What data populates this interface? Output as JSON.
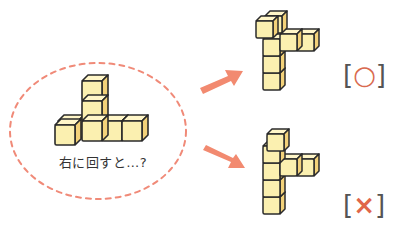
{
  "question": {
    "caption": "右に回すと…?",
    "ellipse_color": "#f08a78"
  },
  "options": [
    {
      "id": "option-a",
      "result_label": "○",
      "correct": true,
      "bracket_open": "[",
      "bracket_close": "]"
    },
    {
      "id": "option-b",
      "result_label": "×",
      "correct": false,
      "bracket_open": "[",
      "bracket_close": "]"
    }
  ],
  "colors": {
    "cube_front": "#fbf0b0",
    "cube_top": "#fff6c8",
    "cube_side": "#f3d27a",
    "outline": "#2b2b2b",
    "arrow": "#f28a70",
    "circle_mark": "#d96a4f",
    "cross_mark": "#e0664a"
  }
}
